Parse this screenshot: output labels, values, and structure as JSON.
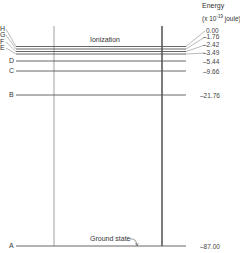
{
  "axis": {
    "title": "Energy",
    "unit": "(x 10",
    "unit_exp": "-19",
    "unit_tail": " joule)"
  },
  "annotations": {
    "ionization": "Ionization",
    "ground_state": "Ground state"
  },
  "levels": [
    {
      "label": "H",
      "value": "0.00"
    },
    {
      "label": "G",
      "value": "–1.76"
    },
    {
      "label": "F",
      "value": "–2.42"
    },
    {
      "label": "E",
      "value": "–3.49"
    },
    {
      "label": "D",
      "value": "–5.44"
    },
    {
      "label": "C",
      "value": "–9.66"
    },
    {
      "label": "B",
      "value": "–21.76"
    },
    {
      "label": "A",
      "value": "–87.00"
    }
  ],
  "colors": {
    "line": "#555555",
    "text": "#333333"
  }
}
